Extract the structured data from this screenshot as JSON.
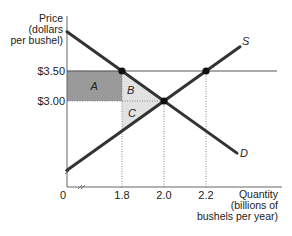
{
  "chart_data": {
    "type": "diagram",
    "ylabel_lines": [
      "Price",
      "(dollars",
      "per bushel)"
    ],
    "xlabel_lines": [
      "Quantity",
      "(billions of",
      "bushels per year)"
    ],
    "origin_label": "0",
    "y_ticks": [
      {
        "label": "$3.50",
        "value": 3.5
      },
      {
        "label": "$3.00",
        "value": 3.0
      }
    ],
    "x_ticks": [
      {
        "label": "1.8",
        "value": 1.8
      },
      {
        "label": "2.0",
        "value": 2.0
      },
      {
        "label": "2.2",
        "value": 2.2
      }
    ],
    "curves": [
      {
        "name": "D",
        "label": "D",
        "kind": "demand"
      },
      {
        "name": "S",
        "label": "S",
        "kind": "supply"
      }
    ],
    "price_floor": 3.5,
    "equilibrium": {
      "quantity": 2.0,
      "price": 3.0
    },
    "points": [
      {
        "name": "demand-at-floor",
        "quantity": 1.8,
        "price": 3.5
      },
      {
        "name": "equilibrium",
        "quantity": 2.0,
        "price": 3.0
      },
      {
        "name": "supply-at-floor",
        "quantity": 2.2,
        "price": 3.5
      }
    ],
    "regions": [
      {
        "label": "A",
        "shade": "dark",
        "color": "#9a9a9a"
      },
      {
        "label": "B",
        "shade": "light",
        "color": "#e2e2e2"
      },
      {
        "label": "C",
        "shade": "light",
        "color": "#e2e2e2"
      }
    ],
    "axis_break": true
  }
}
